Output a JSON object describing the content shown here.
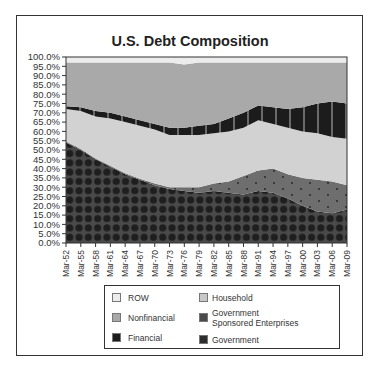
{
  "chart_data": {
    "type": "area",
    "stacked": true,
    "title": "U.S. Debt Composition",
    "xlabel": "",
    "ylabel": "",
    "ylim": [
      0,
      100
    ],
    "y_ticks": [
      "0.0%",
      "5.0%",
      "10.0%",
      "15.0%",
      "20.0%",
      "25.0%",
      "30.0%",
      "35.0%",
      "40.0%",
      "45.0%",
      "50.0%",
      "55.0%",
      "60.0%",
      "65.0%",
      "70.0%",
      "75.0%",
      "80.0%",
      "85.0%",
      "90.0%",
      "95.0%",
      "100.0%"
    ],
    "categories": [
      "Mar-52",
      "Mar-55",
      "Mar-58",
      "Mar-61",
      "Mar-64",
      "Mar-67",
      "Mar-70",
      "Mar-73",
      "Mar-76",
      "Mar-79",
      "Mar-82",
      "Mar-85",
      "Mar-88",
      "Mar-91",
      "Mar-94",
      "Mar-97",
      "Mar-00",
      "Mar-03",
      "Mar-06",
      "Mar-09"
    ],
    "series": [
      {
        "name": "Government",
        "color": "#2e2e2e",
        "values": [
          54,
          50,
          45,
          41,
          37,
          34,
          31,
          29,
          28,
          27,
          28,
          27,
          26,
          28,
          27,
          24,
          20,
          17,
          16,
          18
        ]
      },
      {
        "name": "Government Sponsored Enterprises",
        "color": "#5a5a5a",
        "values": [
          0.5,
          0.5,
          0.5,
          0.5,
          0.5,
          0.5,
          1,
          1,
          2,
          3,
          4,
          6,
          10,
          11,
          13,
          13,
          15,
          17,
          17,
          13
        ]
      },
      {
        "name": "Household",
        "color": "#d2d2d2",
        "values": [
          17.5,
          20.5,
          22.5,
          25.5,
          27.5,
          28.5,
          29,
          28,
          28,
          28,
          27,
          27,
          26,
          27,
          24,
          25,
          25,
          25,
          24,
          25
        ]
      },
      {
        "name": "Financial",
        "color": "#1c1c1c",
        "values": [
          1.5,
          2,
          3,
          3,
          3,
          3,
          3,
          4,
          4,
          5,
          5,
          7,
          8,
          8,
          9,
          10,
          13,
          16,
          19,
          19
        ]
      },
      {
        "name": "Nonfinancial",
        "color": "#a9a9a9",
        "values": [
          23.5,
          24,
          26,
          27,
          29,
          31,
          33,
          35,
          34,
          34,
          33,
          30,
          27,
          23,
          24,
          25,
          24,
          22,
          21,
          22
        ]
      },
      {
        "name": "ROW",
        "color": "#ececec",
        "values": [
          3,
          3,
          3,
          3,
          3,
          3,
          3,
          3,
          4,
          3,
          3,
          3,
          3,
          3,
          3,
          3,
          3,
          3,
          3,
          3
        ]
      }
    ],
    "grid": false,
    "legend_position": "bottom"
  },
  "legend": [
    {
      "label": "ROW",
      "color": "#ececec"
    },
    {
      "label": "Household",
      "color": "#c8c8c8"
    },
    {
      "label": "Nonfinancial",
      "color": "#a9a9a9"
    },
    {
      "label": "Government",
      "label2": "Sponsored Enterprises",
      "color": "#4a4a4a"
    },
    {
      "label": "Financial",
      "color": "#1c1c1c"
    },
    {
      "label": "Government",
      "color": "#2e2e2e"
    }
  ]
}
